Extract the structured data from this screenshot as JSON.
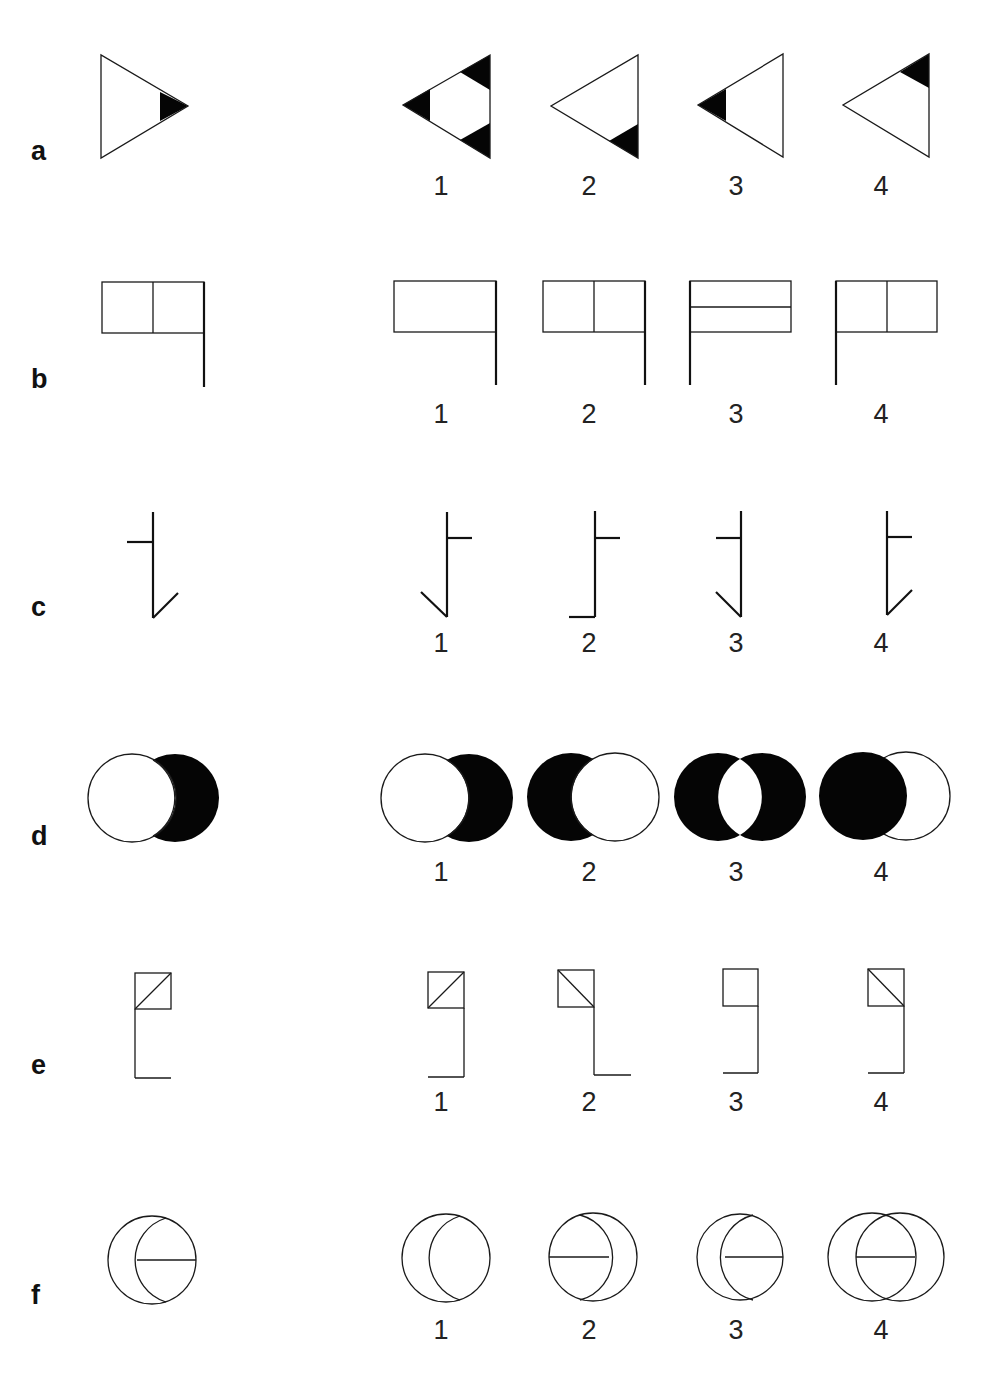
{
  "rows": [
    {
      "label": "a",
      "figure_type": "triangle-with-shaded-corner",
      "reference": "right-pointing triangle, black tip at right vertex",
      "options": [
        {
          "number": "1",
          "description": "left-pointing triangle, all three corners black"
        },
        {
          "number": "2",
          "description": "left-pointing triangle, bottom-right corner black"
        },
        {
          "number": "3",
          "description": "left-pointing triangle, left tip black"
        },
        {
          "number": "4",
          "description": "left-pointing triangle, top-right corner black"
        }
      ]
    },
    {
      "label": "b",
      "figure_type": "flag",
      "reference": "flag on right pole, vertical divider",
      "options": [
        {
          "number": "1",
          "description": "flag on right pole, no divider"
        },
        {
          "number": "2",
          "description": "flag on right pole, vertical divider"
        },
        {
          "number": "3",
          "description": "flag on left pole, horizontal divider"
        },
        {
          "number": "4",
          "description": "flag on left pole, vertical divider"
        }
      ]
    },
    {
      "label": "c",
      "figure_type": "line-stroke",
      "reference": "tick to left, foot slanting up-right",
      "options": [
        {
          "number": "1",
          "description": "tick to right, foot slanting up-left"
        },
        {
          "number": "2",
          "description": "tick to right, horizontal foot to left"
        },
        {
          "number": "3",
          "description": "tick to left, foot slanting up-left"
        },
        {
          "number": "4",
          "description": "tick to right, foot slanting up-right"
        }
      ]
    },
    {
      "label": "d",
      "figure_type": "overlapping-circles",
      "reference": "right crescent black",
      "options": [
        {
          "number": "1",
          "description": "right crescent black"
        },
        {
          "number": "2",
          "description": "left crescent black"
        },
        {
          "number": "3",
          "description": "both crescents black"
        },
        {
          "number": "4",
          "description": "left full circle black"
        }
      ]
    },
    {
      "label": "e",
      "figure_type": "square-with-bracket",
      "reference": "square with / diagonal, bracket on left, foot right",
      "options": [
        {
          "number": "1",
          "description": "square with / diagonal, bracket on right, foot left"
        },
        {
          "number": "2",
          "description": "square with \\ diagonal, bracket on right, foot right"
        },
        {
          "number": "3",
          "description": "empty square, bracket on right, foot left"
        },
        {
          "number": "4",
          "description": "square with \\ diagonal, bracket on right, foot left"
        }
      ]
    },
    {
      "label": "f",
      "figure_type": "circle-with-arc",
      "reference": "circle, inner arc at right, horizontal chord in right lens",
      "options": [
        {
          "number": "1",
          "description": "circle, inner arc at right, no chord"
        },
        {
          "number": "2",
          "description": "circle, inner arc at left, chord in left lens"
        },
        {
          "number": "3",
          "description": "circle, inner arc at right, chord in right lens"
        },
        {
          "number": "4",
          "description": "two overlapping circles, chord in lens"
        }
      ]
    }
  ]
}
